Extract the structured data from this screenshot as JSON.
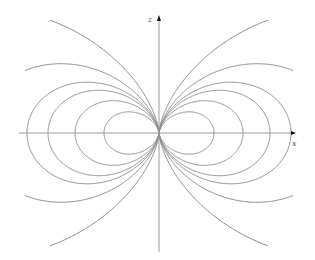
{
  "figure": {
    "width": 315,
    "height": 260,
    "background": "#ffffff",
    "line_color": "#8a8a8a",
    "axis_color": "#9a9a9a",
    "arrow_color": "#111111",
    "origin": {
      "x": 159,
      "y": 133
    },
    "axes": {
      "x": {
        "label": "x",
        "from": 19,
        "to": 296,
        "label_pos": {
          "x": 292,
          "y": 146
        }
      },
      "z": {
        "label": "z",
        "from": 252,
        "to": 15,
        "label_pos": {
          "x": 148,
          "y": 22
        }
      }
    },
    "field_lines": {
      "equation": "r = C sin^2(theta)",
      "C_values": [
        55,
        84,
        111,
        132,
        180,
        325
      ],
      "max_abs_dx": 134,
      "max_abs_dz": 113
    }
  }
}
